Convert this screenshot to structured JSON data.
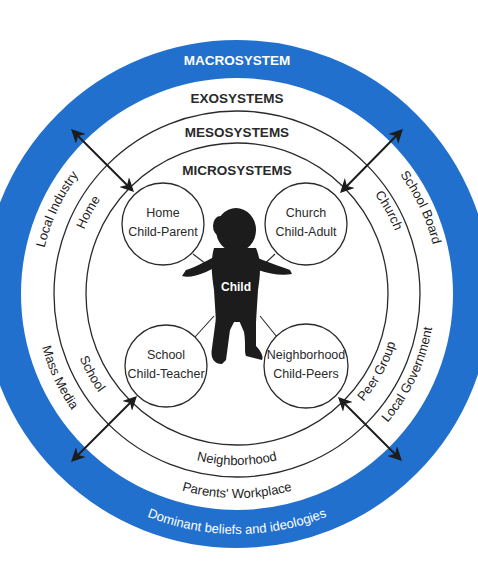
{
  "diagram": {
    "colors": {
      "macro_ring": "#2270CE",
      "line": "#2a2a2a",
      "child": "#1c1c1c",
      "background": "#ffffff"
    },
    "layers": {
      "macrosystem": "MACROSYSTEM",
      "exosystems": "EXOSYSTEMS",
      "mesosystems": "MESOSYSTEMS",
      "microsystems": "MICROSYSTEMS"
    },
    "macro_caption": "Dominant beliefs and ideologies",
    "exo_items": {
      "top_left": "Local Industry",
      "top_right": "School Board",
      "bottom_left": "Mass Media",
      "bottom_right": "Local Government",
      "bottom": "Parents' Workplace"
    },
    "meso_items": {
      "top_left": "Home",
      "top_right": "Church",
      "bottom_left": "School",
      "bottom_right": "Peer Group",
      "bottom": "Neighborhood"
    },
    "micro_nodes": [
      {
        "setting": "Home",
        "relation": "Child-Parent"
      },
      {
        "setting": "Church",
        "relation": "Child-Adult"
      },
      {
        "setting": "School",
        "relation": "Child-Teacher"
      },
      {
        "setting": "Neighborhood",
        "relation": "Child-Peers"
      }
    ],
    "center_label": "Child"
  }
}
